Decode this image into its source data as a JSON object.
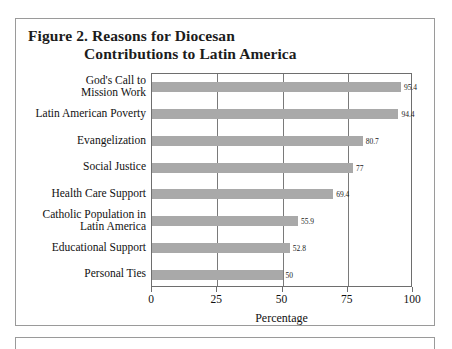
{
  "figure": {
    "title_line_1": "Figure 2.  Reasons for Diocesan",
    "title_line_2": "Contributions to Latin America"
  },
  "chart_data": {
    "type": "bar",
    "orientation": "horizontal",
    "title": "Figure 2.  Reasons for Diocesan Contributions to Latin America",
    "xlabel": "Percentage",
    "ylabel": "",
    "xlim": [
      0,
      100
    ],
    "xticks": [
      0,
      25,
      50,
      75,
      100
    ],
    "xtick_labels": [
      "0",
      "25",
      "50",
      "75",
      "100"
    ],
    "grid": true,
    "legend": false,
    "bar_color": "#a9a9a9",
    "categories": [
      "God's Call to\nMission Work",
      "Latin American Poverty",
      "Evangelization",
      "Social Justice",
      "Health Care Support",
      "Catholic Population in\nLatin America",
      "Educational Support",
      "Personal Ties"
    ],
    "category_lines": [
      [
        "God's Call to",
        "Mission Work"
      ],
      [
        "Latin American Poverty"
      ],
      [
        "Evangelization"
      ],
      [
        "Social Justice"
      ],
      [
        "Health Care Support"
      ],
      [
        "Catholic Population in",
        "Latin America"
      ],
      [
        "Educational Support"
      ],
      [
        "Personal Ties"
      ]
    ],
    "values": [
      95.4,
      94.4,
      80.7,
      77,
      69.4,
      55.9,
      52.8,
      50
    ],
    "value_labels": [
      "95.4",
      "94.4",
      "80.7",
      "77",
      "69.4",
      "55.9",
      "52.8",
      "50"
    ]
  }
}
